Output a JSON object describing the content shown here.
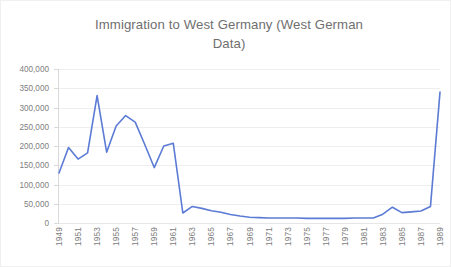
{
  "chart_data": {
    "type": "line",
    "title": "Immigration to West Germany (West German Data)",
    "title_line1": "Immigration to West Germany (West German",
    "title_line2": "Data)",
    "xlabel": "",
    "ylabel": "",
    "ylim": [
      0,
      400000
    ],
    "y_ticks": [
      "0",
      "50,000",
      "100,000",
      "150,000",
      "200,000",
      "250,000",
      "300,000",
      "350,000",
      "400,000"
    ],
    "y_tick_values": [
      0,
      50000,
      100000,
      150000,
      200000,
      250000,
      300000,
      350000,
      400000
    ],
    "grid": "horizontal",
    "legend": "none",
    "series_color": "#5b7bd5",
    "x_tick_labels": [
      "1949",
      "1951",
      "1953",
      "1955",
      "1957",
      "1959",
      "1961",
      "1963",
      "1965",
      "1967",
      "1969",
      "1971",
      "1973",
      "1975",
      "1977",
      "1979",
      "1981",
      "1983",
      "1985",
      "1987",
      "1989"
    ],
    "x": [
      1949,
      1950,
      1951,
      1952,
      1953,
      1954,
      1955,
      1956,
      1957,
      1958,
      1959,
      1960,
      1961,
      1962,
      1963,
      1964,
      1965,
      1966,
      1967,
      1968,
      1969,
      1970,
      1971,
      1972,
      1973,
      1974,
      1975,
      1976,
      1977,
      1978,
      1979,
      1980,
      1981,
      1982,
      1983,
      1984,
      1985,
      1986,
      1987,
      1988,
      1989
    ],
    "values": [
      130000,
      196000,
      166000,
      182000,
      331000,
      184000,
      252000,
      279000,
      262000,
      204000,
      144000,
      200000,
      207000,
      26000,
      43000,
      38000,
      32000,
      28000,
      22000,
      18000,
      15000,
      14000,
      13000,
      13000,
      13000,
      13000,
      12000,
      12000,
      12000,
      12000,
      12000,
      13000,
      13000,
      13000,
      23000,
      41000,
      27000,
      29000,
      31000,
      43000,
      340000
    ],
    "series": [
      {
        "name": "Immigration to West Germany",
        "values": [
          130000,
          196000,
          166000,
          182000,
          331000,
          184000,
          252000,
          279000,
          262000,
          204000,
          144000,
          200000,
          207000,
          26000,
          43000,
          38000,
          32000,
          28000,
          22000,
          18000,
          15000,
          14000,
          13000,
          13000,
          13000,
          13000,
          12000,
          12000,
          12000,
          12000,
          12000,
          13000,
          13000,
          13000,
          23000,
          41000,
          27000,
          29000,
          31000,
          43000,
          340000
        ]
      }
    ]
  }
}
